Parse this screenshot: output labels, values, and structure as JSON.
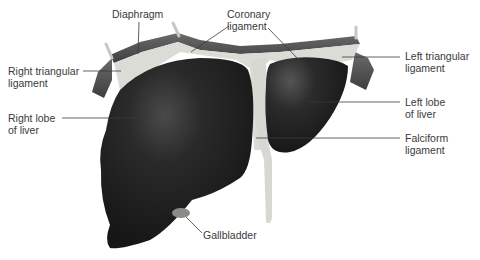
{
  "diagram": {
    "colors": {
      "liver": "#232323",
      "ligament": "#d9d9d4",
      "diaphragm": "#5a5a5a",
      "leader_line": "#3a3a3a",
      "text": "#3a3a3a"
    },
    "labels": {
      "diaphragm": "Diaphragm",
      "coronary_ligament": "Coronary\nligament",
      "right_triangular_ligament": "Right triangular\nligament",
      "left_triangular_ligament": "Left triangular\nligament",
      "right_lobe": "Right lobe\nof liver",
      "left_lobe": "Left lobe\nof liver",
      "falciform_ligament": "Falciform\nligament",
      "gallbladder": "Gallbladder"
    }
  }
}
